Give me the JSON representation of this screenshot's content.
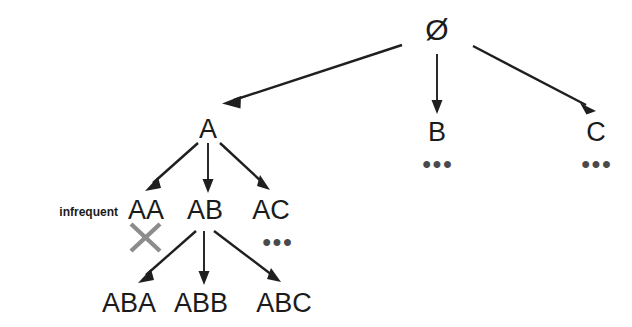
{
  "diagram": {
    "type": "tree",
    "title": "",
    "background_color": "#ffffff",
    "ink_color": "#1b1b1b",
    "cross_color": "#8c8c8c",
    "nodes": {
      "root": "Ø",
      "level1": {
        "a": "A",
        "b": "B",
        "c": "C"
      },
      "level2": {
        "aa": "AA",
        "ab": "AB",
        "ac": "AC"
      },
      "level3": {
        "aba": "ABA",
        "abb": "ABB",
        "abc": "ABC"
      }
    },
    "ellipses": {
      "under_b": "•••",
      "under_c": "•••",
      "under_ac": "•••"
    },
    "annotations": {
      "infrequent": "infrequent"
    },
    "pruned_node": "AA",
    "edges": [
      {
        "from": "Ø",
        "to": "A"
      },
      {
        "from": "Ø",
        "to": "B"
      },
      {
        "from": "Ø",
        "to": "C"
      },
      {
        "from": "A",
        "to": "AA"
      },
      {
        "from": "A",
        "to": "AB"
      },
      {
        "from": "A",
        "to": "AC"
      },
      {
        "from": "AB",
        "to": "ABA"
      },
      {
        "from": "AB",
        "to": "ABB"
      },
      {
        "from": "AB",
        "to": "ABC"
      }
    ]
  }
}
